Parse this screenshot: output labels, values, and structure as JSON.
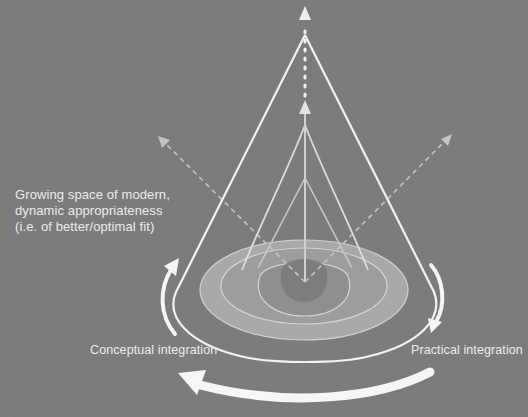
{
  "diagram": {
    "title_lines": [
      "Growing space of modern,",
      "dynamic appropriateness",
      "(i.e. of better/optimal fit)"
    ],
    "labels": {
      "conceptual": "Conceptual integration",
      "practical": "Practical integration"
    },
    "colors": {
      "background": "#7a7a7a",
      "outer_ring": "#a9a9a9",
      "middle_ring": "#9a9a9a",
      "inner_ring": "#8a8a8a",
      "core": "#7e7e7e",
      "line": "#f4f4f4",
      "dashed": "#c4c4c4"
    },
    "elements": {
      "cones": [
        "outer-cone",
        "middle-cone",
        "inner-cone"
      ],
      "rings": [
        "outer-ring",
        "middle-ring",
        "inner-ring",
        "core"
      ],
      "axes": [
        "vertical-axis-dotted",
        "left-diagonal-dashed",
        "right-diagonal-dashed"
      ],
      "rotation_arrows": [
        "left-up-arrow",
        "right-down-arrow",
        "bottom-left-arrow"
      ]
    }
  }
}
